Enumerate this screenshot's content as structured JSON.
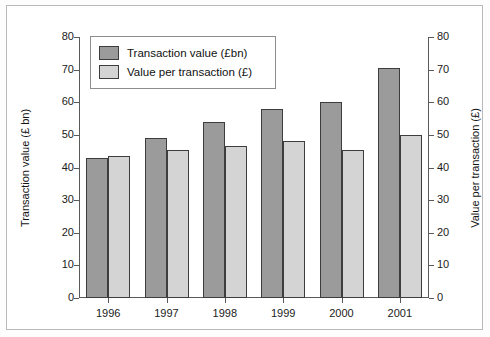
{
  "chart_data": {
    "type": "bar",
    "title": "",
    "categories": [
      "1996",
      "1997",
      "1998",
      "1999",
      "2000",
      "2001"
    ],
    "series": [
      {
        "name": "Transaction value (£bn)",
        "axis": "left",
        "color": "#9b9b9b",
        "values": [
          43,
          49,
          54,
          58,
          60,
          70.5
        ]
      },
      {
        "name": "Value per transaction (£)",
        "axis": "right",
        "color": "#d4d4d4",
        "values": [
          43.5,
          45.5,
          46.5,
          48,
          45.5,
          50
        ]
      }
    ],
    "xlabel": "",
    "ylabel": "Transaction value (£ bn)",
    "y2label": "Value per transaction (£)",
    "ylim": [
      0,
      80
    ],
    "y2lim": [
      0,
      80
    ],
    "yticks": [
      0,
      10,
      20,
      30,
      40,
      50,
      60,
      70,
      80
    ],
    "y2ticks": [
      0,
      10,
      20,
      30,
      40,
      50,
      60,
      70,
      80
    ],
    "grid": false,
    "legend_position": "top-left"
  },
  "axes": {
    "left_title": "Transaction value (£ bn)",
    "right_title": "Value per transaction (£)",
    "left_ticks": [
      "0",
      "10",
      "20",
      "30",
      "40",
      "50",
      "60",
      "70",
      "80"
    ],
    "right_ticks": [
      "0",
      "10",
      "20",
      "30",
      "40",
      "50",
      "60",
      "70",
      "80"
    ],
    "category_labels": [
      "1996",
      "1997",
      "1998",
      "1999",
      "2000",
      "2001"
    ]
  },
  "legend": {
    "items": [
      {
        "label": "Transaction value (£bn)",
        "color": "#9b9b9b"
      },
      {
        "label": "Value per transaction (£)",
        "color": "#d4d4d4"
      }
    ]
  },
  "colors": {
    "series_dark": "#9b9b9b",
    "series_light": "#d4d4d4",
    "bar_outline": "#3d3d3d",
    "axis": "#5a5a5a",
    "frame": "#b9b9b9",
    "background": "#ffffff"
  }
}
